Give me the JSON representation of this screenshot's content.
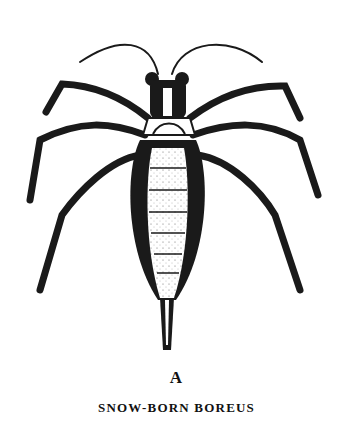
{
  "figure": {
    "plate_letter": "A",
    "caption": "SNOW-BORN BOREUS",
    "ink_color": "#1a1a1a",
    "paper_color": "#ffffff"
  }
}
